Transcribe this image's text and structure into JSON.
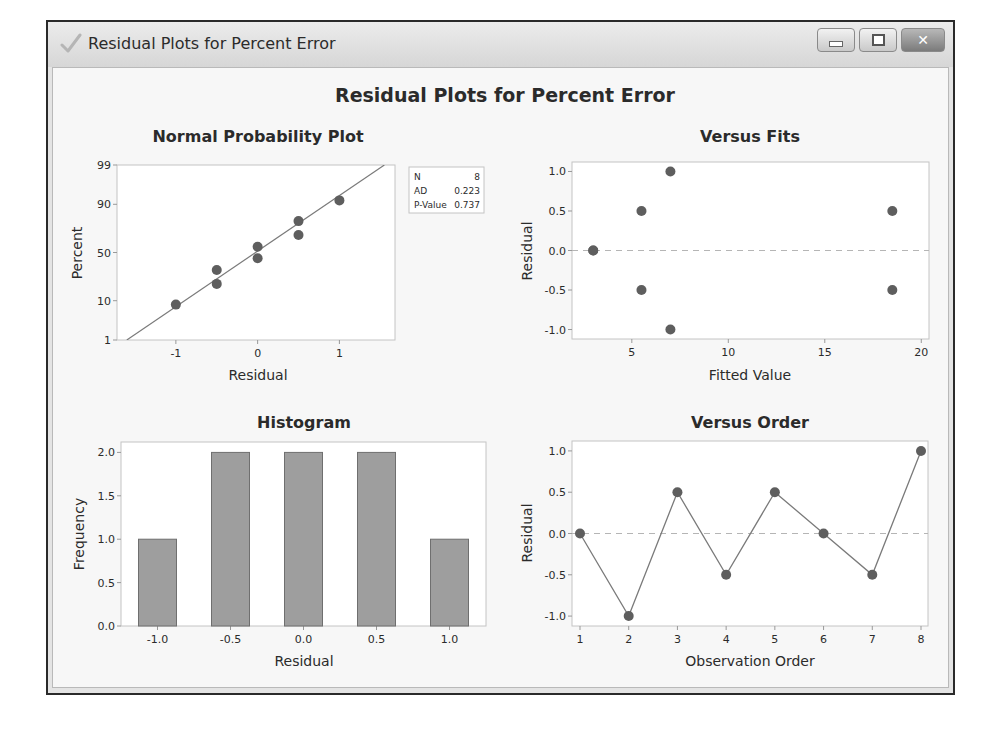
{
  "window": {
    "title": "Residual Plots for Percent Error",
    "icon": "checkmark-icon",
    "buttons": {
      "minimize": "minimize-icon",
      "maximize": "maximize-icon",
      "close": "close-icon"
    }
  },
  "figure": {
    "title": "Residual Plots for Percent Error"
  },
  "colors": {
    "marker": "#5e5e5e",
    "line": "#7a7a7a",
    "bar_fill": "#9e9e9e",
    "bar_edge": "#6f6f6f",
    "ref_line": "#b5b5b5",
    "frame": "#c4c4c4"
  },
  "chart_data": [
    {
      "id": "npp",
      "type": "scatter",
      "title": "Normal Probability Plot",
      "xlabel": "Residual",
      "ylabel": "Percent",
      "xticks": [
        "-1",
        "0",
        "1"
      ],
      "yticks": [
        "1",
        "10",
        "50",
        "90",
        "99"
      ],
      "xlim": [
        -1.72,
        1.68
      ],
      "ylim": [
        1,
        99
      ],
      "y_scale": "normal-probability",
      "points": [
        {
          "x": -1.0,
          "y": 8.3
        },
        {
          "x": -0.5,
          "y": 20.2
        },
        {
          "x": -0.5,
          "y": 32.1
        },
        {
          "x": 0.0,
          "y": 44.0
        },
        {
          "x": 0.0,
          "y": 56.0
        },
        {
          "x": 0.5,
          "y": 67.9
        },
        {
          "x": 0.5,
          "y": 79.8
        },
        {
          "x": 1.0,
          "y": 91.7
        }
      ],
      "fit_line": {
        "x": [
          -1.6,
          1.55
        ],
        "y": [
          1,
          99
        ]
      },
      "legend": {
        "position": "right",
        "rows": [
          {
            "label": "N",
            "value": "8"
          },
          {
            "label": "AD",
            "value": "0.223"
          },
          {
            "label": "P-Value",
            "value": "0.737"
          }
        ]
      }
    },
    {
      "id": "versus_fits",
      "type": "scatter",
      "title": "Versus Fits",
      "xlabel": "Fitted Value",
      "ylabel": "Residual",
      "xticks": [
        "5",
        "10",
        "15",
        "20"
      ],
      "yticks": [
        "-1.0",
        "-0.5",
        "0.0",
        "0.5",
        "1.0"
      ],
      "xlim": [
        1.9,
        20.4
      ],
      "ylim": [
        -1.12,
        1.12
      ],
      "points": [
        {
          "x": 3.0,
          "y": 0.0
        },
        {
          "x": 3.0,
          "y": 0.0
        },
        {
          "x": 5.5,
          "y": 0.5
        },
        {
          "x": 5.5,
          "y": -0.5
        },
        {
          "x": 7.0,
          "y": 1.0
        },
        {
          "x": 7.0,
          "y": -1.0
        },
        {
          "x": 18.5,
          "y": 0.5
        },
        {
          "x": 18.5,
          "y": -0.5
        }
      ],
      "reference_line": 0.0
    },
    {
      "id": "histogram",
      "type": "bar",
      "title": "Histogram",
      "xlabel": "Residual",
      "ylabel": "Frequency",
      "categories": [
        "-1.0",
        "-0.5",
        "0.0",
        "0.5",
        "1.0"
      ],
      "values": [
        1,
        2,
        2,
        2,
        1
      ],
      "yticks": [
        "0.0",
        "0.5",
        "1.0",
        "1.5",
        "2.0"
      ],
      "ylim": [
        0,
        2.12
      ]
    },
    {
      "id": "versus_order",
      "type": "line",
      "title": "Versus Order",
      "xlabel": "Observation Order",
      "ylabel": "Residual",
      "x": [
        1,
        2,
        3,
        4,
        5,
        6,
        7,
        8
      ],
      "values": [
        0.0,
        -1.0,
        0.5,
        -0.5,
        0.5,
        0.0,
        -0.5,
        1.0
      ],
      "xticks": [
        "1",
        "2",
        "3",
        "4",
        "5",
        "6",
        "7",
        "8"
      ],
      "yticks": [
        "-1.0",
        "-0.5",
        "0.0",
        "0.5",
        "1.0"
      ],
      "ylim": [
        -1.12,
        1.12
      ],
      "reference_line": 0.0
    }
  ]
}
